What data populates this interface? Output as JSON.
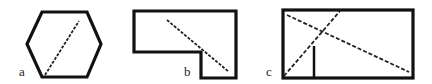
{
  "figures": [
    {
      "label": "a",
      "shape": "hexagon",
      "diagonal": "dashed"
    },
    {
      "label": "b",
      "shape": "L-shaped polygon",
      "diagonal": "dashed"
    },
    {
      "label": "c",
      "shape": "rectangle",
      "diagonals": [
        "dashed",
        "dashed"
      ],
      "segment": "solid vertical"
    }
  ],
  "stroke_color": "#111111"
}
